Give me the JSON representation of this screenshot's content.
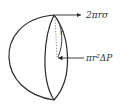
{
  "diagram": {
    "labels": {
      "surface_tension_force": "2πrσ",
      "pressure_force": "πr²ΔP",
      "radius": "r"
    },
    "colors": {
      "stroke": "#2a2a2a",
      "text": "#333333",
      "dotted": "#888888"
    }
  }
}
